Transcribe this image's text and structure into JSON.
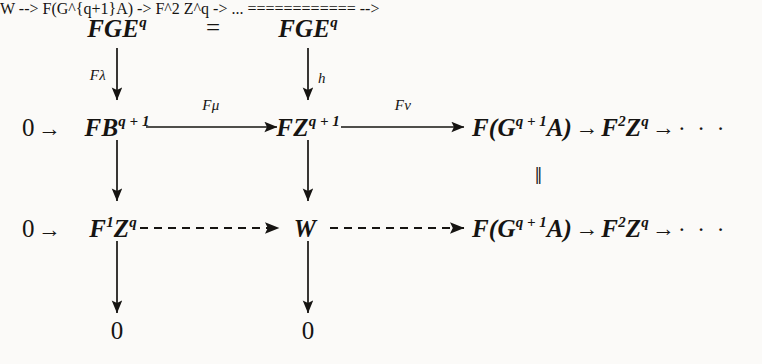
{
  "diagram": {
    "background_color": "#fbfaf8",
    "ink_color": "#161412",
    "nodes": {
      "top_left": {
        "label": "FGE",
        "sup": "q"
      },
      "top_right": {
        "label": "FGE",
        "sup": "q"
      },
      "top_equals": "=",
      "mid_zero_left": "0",
      "mid_arrow_left": "→",
      "mid_left": {
        "label": "FB",
        "sup": "q + 1"
      },
      "mid_center": {
        "label": "FZ",
        "sup": "q + 1"
      },
      "mid_right_1": {
        "label": "F(G",
        "sup": "q + 1",
        "tail": "A)"
      },
      "mid_arrow_r1": "→",
      "mid_right_2": {
        "label": "F",
        "sup": "2",
        "tail": "Z",
        "tail_sup": "q"
      },
      "mid_arrow_r2": "→",
      "mid_dots": "· · ·",
      "vertical_equals": "‖",
      "low_zero_left": "0",
      "low_arrow_left": "→",
      "low_left": {
        "label": "F",
        "sup": "1",
        "tail": "Z",
        "tail_sup": "q"
      },
      "low_center": {
        "label": "W"
      },
      "low_right_1": {
        "label": "F(G",
        "sup": "q + 1",
        "tail": "A)"
      },
      "low_arrow_r1": "→",
      "low_right_2": {
        "label": "F",
        "sup": "2",
        "tail": "Z",
        "tail_sup": "q"
      },
      "low_arrow_r2": "→",
      "low_dots": "· · ·",
      "bottom_zero_left": "0",
      "bottom_zero_center": "0"
    },
    "morphism_labels": {
      "f_lambda": "Fλ",
      "h": "h",
      "f_mu": "Fμ",
      "f_nu": "Fν"
    },
    "arrows": [
      {
        "name": "FGE-to-FB",
        "style": "solid",
        "direction": "down",
        "label": "Fλ"
      },
      {
        "name": "FGE-to-FZ",
        "style": "solid",
        "direction": "down",
        "label": "h"
      },
      {
        "name": "FB-to-FZ",
        "style": "solid",
        "direction": "right",
        "label": "Fμ"
      },
      {
        "name": "FZ-to-FGA",
        "style": "solid",
        "direction": "right",
        "label": "Fν"
      },
      {
        "name": "FB-to-F1Z",
        "style": "solid",
        "direction": "down",
        "label": ""
      },
      {
        "name": "FZ-to-W",
        "style": "solid",
        "direction": "down",
        "label": ""
      },
      {
        "name": "F1Z-to-W",
        "style": "dashed",
        "direction": "right",
        "label": ""
      },
      {
        "name": "W-to-FGA",
        "style": "dashed",
        "direction": "right",
        "label": ""
      },
      {
        "name": "F1Z-to-0",
        "style": "solid",
        "direction": "down",
        "label": ""
      },
      {
        "name": "W-to-0",
        "style": "solid",
        "direction": "down",
        "label": ""
      }
    ]
  }
}
